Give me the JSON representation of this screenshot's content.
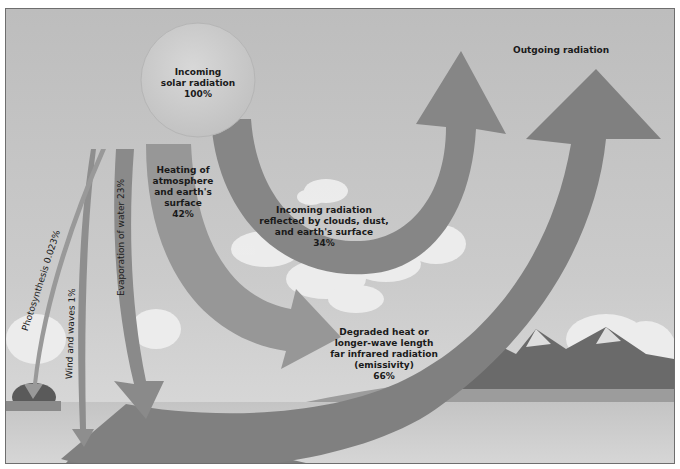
{
  "diagram": {
    "colors": {
      "sky_top": "#bdbdbd",
      "sky_bottom": "#d9d9d9",
      "arrow_dark": "#7d7d7d",
      "arrow_mid": "#8f8f8f",
      "arrow_light": "#a5a5a5",
      "sun": "#cfcfcf",
      "water": "#b4b4b4",
      "land": "#9c9c9c",
      "frame_border": "#6e6e6e"
    },
    "nodes": {
      "sun": {
        "line1": "Incoming",
        "line2": "solar radiation",
        "value": "100%"
      },
      "outgoing": {
        "label": "Outgoing radiation"
      },
      "heating": {
        "line1": "Heating of",
        "line2": "atmosphere",
        "line3": "and earth's",
        "line4": "surface",
        "value": "42%"
      },
      "reflected": {
        "line1": "Incoming radiation",
        "line2": "reflected by clouds, dust,",
        "line3": "and earth's surface",
        "value": "34%"
      },
      "degraded": {
        "line1": "Degraded heat or",
        "line2": "longer-wave length",
        "line3": "far infrared radiation",
        "line4": "(emissivity)",
        "value": "66%"
      },
      "photosynthesis": {
        "label": "Photosynthesis 0.023%"
      },
      "wind": {
        "label": "Wind and waves 1%"
      },
      "evaporation": {
        "label": "Evaporation of water 23%"
      }
    },
    "flows": [
      {
        "from": "Incoming solar radiation",
        "to": "Outgoing radiation",
        "label": "Incoming radiation reflected by clouds, dust, and earth's surface",
        "percent": 34
      },
      {
        "from": "Incoming solar radiation",
        "to": "Earth surface",
        "label": "Heating of atmosphere and earth's surface",
        "percent": 42
      },
      {
        "from": "Incoming solar radiation",
        "to": "Water",
        "label": "Evaporation of water",
        "percent": 23
      },
      {
        "from": "Incoming solar radiation",
        "to": "Water",
        "label": "Wind and waves",
        "percent": 1
      },
      {
        "from": "Incoming solar radiation",
        "to": "Vegetation",
        "label": "Photosynthesis",
        "percent": 0.023
      },
      {
        "from": "Earth surface",
        "to": "Outgoing radiation",
        "label": "Degraded heat or longer-wave length far infrared radiation (emissivity)",
        "percent": 66
      }
    ]
  }
}
